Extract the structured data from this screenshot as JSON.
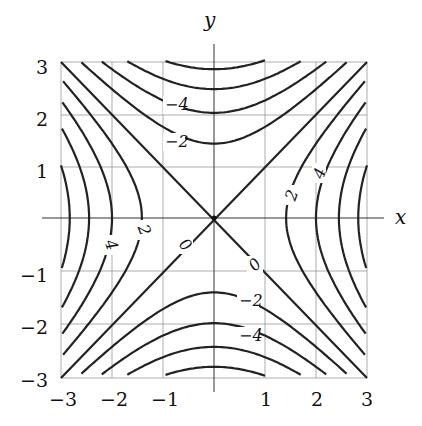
{
  "chart_data": {
    "type": "contour",
    "function": "x^2 - y^2",
    "title": "",
    "xlabel": "x",
    "ylabel": "y",
    "xlim": [
      -3,
      3
    ],
    "ylim": [
      -3,
      3
    ],
    "grid": true,
    "xticks": [
      "−3",
      "−2",
      "−1",
      "1",
      "2",
      "3"
    ],
    "yticks": [
      "3",
      "2",
      "1",
      "−1",
      "−2",
      "−3"
    ],
    "levels": [
      -8,
      -6,
      -4,
      -2,
      0,
      2,
      4,
      6,
      8
    ],
    "labeled_levels": [
      {
        "text": "−4",
        "x": -0.8,
        "y": 2.15
      },
      {
        "text": "−2",
        "x": -0.8,
        "y": 1.45
      },
      {
        "text": "2",
        "x": 1.45,
        "y": 0.45
      },
      {
        "text": "4",
        "x": 2.0,
        "y": 0.9
      },
      {
        "text": "4",
        "x": -2.0,
        "y": -0.35
      },
      {
        "text": "2",
        "x": -1.4,
        "y": -0.2
      },
      {
        "text": "0",
        "x": -0.55,
        "y": -0.55
      },
      {
        "text": "0",
        "x": 0.8,
        "y": -0.85
      },
      {
        "text": "−2",
        "x": 0.9,
        "y": -1.5
      },
      {
        "text": "−4",
        "x": 0.9,
        "y": -2.15
      }
    ]
  },
  "labels": {
    "x_axis": "x",
    "y_axis": "y",
    "contour_labels": [
      "−4",
      "−2",
      "2",
      "4",
      "4",
      "2",
      "0",
      "0",
      "−2",
      "−4"
    ],
    "xticks": [
      "−3",
      "−2",
      "−1",
      "1",
      "2",
      "3"
    ],
    "yticks": [
      "3",
      "2",
      "1",
      "−1",
      "−2",
      "−3"
    ]
  }
}
